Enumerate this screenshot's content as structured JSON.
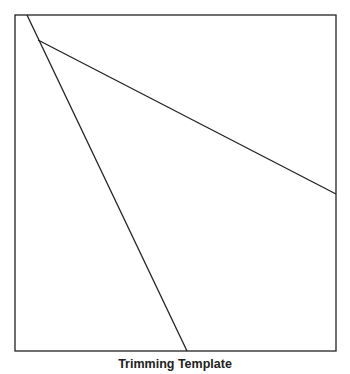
{
  "figure": {
    "caption": "Trimming Template",
    "stroke_color": "#222222",
    "frame": {
      "x": 15,
      "y": 15,
      "width": 321,
      "height": 336
    },
    "lines": [
      {
        "name": "steep-cut-line",
        "x1": 27,
        "y1": 15,
        "x2": 187,
        "y2": 351
      },
      {
        "name": "shallow-cut-line",
        "x1": 38,
        "y1": 40,
        "x2": 336,
        "y2": 194
      }
    ]
  }
}
